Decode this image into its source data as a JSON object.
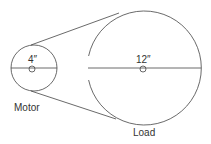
{
  "diagram": {
    "type": "belt-drive",
    "motor": {
      "label": "Motor",
      "diameter_label": "4″"
    },
    "load": {
      "label": "Load",
      "diameter_label": "12″"
    },
    "colors": {
      "stroke": "#444444",
      "background": "#ffffff"
    }
  }
}
